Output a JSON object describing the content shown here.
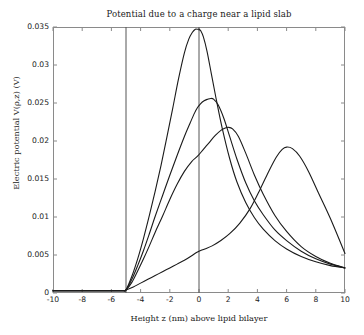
{
  "chart_data": {
    "type": "line",
    "title": "Potential due to a charge near a lipid slab",
    "xlabel": "Height z (nm) above lipid bilayer",
    "ylabel": "Electric potential V(ρ,z) (V)",
    "xlim": [
      -10,
      10
    ],
    "ylim": [
      0,
      0.035
    ],
    "grid": false,
    "legend": "none",
    "xticks": [
      "-10",
      "-8",
      "-6",
      "-4",
      "-2",
      "0",
      "2",
      "4",
      "6",
      "8",
      "10"
    ],
    "xtick_values": [
      -10,
      -8,
      -6,
      -4,
      -2,
      0,
      2,
      4,
      6,
      8,
      10
    ],
    "yticks": [
      "0",
      "0.005",
      "0.01",
      "0.015",
      "0.02",
      "0.025",
      "0.03",
      "0.035"
    ],
    "ytick_values": [
      0,
      0.005,
      0.01,
      0.015,
      0.02,
      0.025,
      0.03,
      0.035
    ],
    "line_color": "#1a1a1a",
    "annotations": [
      {
        "name": "slab-boundary-line",
        "type": "vline",
        "x": -5
      },
      {
        "name": "origin-line",
        "type": "vline",
        "x": 0
      }
    ],
    "series": [
      {
        "name": "curve-peak-at-0",
        "peak_x": 0.0,
        "peak_y": 0.0347,
        "x": [
          -10,
          -8,
          -6,
          -5.2,
          -5,
          -4.6,
          -4.2,
          -3.8,
          -3.4,
          -3,
          -2.6,
          -2.2,
          -1.8,
          -1.4,
          -1.0,
          -0.7,
          -0.45,
          -0.25,
          -0.1,
          0,
          0.12,
          0.3,
          0.55,
          0.85,
          1.2,
          1.6,
          2.1,
          2.6,
          3.2,
          3.8,
          4.4,
          5.2,
          6.0,
          7.0,
          8.0,
          9.0,
          10
        ],
        "y": [
          0.0003,
          0.0003,
          0.0003,
          0.0003,
          0.0004,
          0.0022,
          0.0045,
          0.0072,
          0.0102,
          0.0134,
          0.0168,
          0.0205,
          0.0243,
          0.0282,
          0.0316,
          0.0334,
          0.0343,
          0.0347,
          0.0347,
          0.0347,
          0.0345,
          0.0337,
          0.0318,
          0.0288,
          0.0253,
          0.0216,
          0.0177,
          0.0146,
          0.0119,
          0.0099,
          0.0084,
          0.0069,
          0.0058,
          0.0048,
          0.0041,
          0.0036,
          0.0033
        ]
      },
      {
        "name": "curve-peak-at-0p8",
        "peak_x": 0.8,
        "peak_y": 0.0256,
        "x": [
          -10,
          -8,
          -6,
          -5.2,
          -5,
          -4.6,
          -4.2,
          -3.8,
          -3.4,
          -3,
          -2.5,
          -2,
          -1.5,
          -1.0,
          -0.6,
          -0.3,
          -0.1,
          0.1,
          0.35,
          0.6,
          0.8,
          1.0,
          1.3,
          1.7,
          2.1,
          2.6,
          3.2,
          3.8,
          4.4,
          5.2,
          6.0,
          7.0,
          8.0,
          9.0,
          10
        ],
        "y": [
          0.0003,
          0.0003,
          0.0003,
          0.0003,
          0.0004,
          0.0018,
          0.0036,
          0.0056,
          0.0078,
          0.0101,
          0.0128,
          0.0155,
          0.0181,
          0.0206,
          0.0224,
          0.0237,
          0.0244,
          0.0249,
          0.0253,
          0.0255,
          0.0256,
          0.0255,
          0.0248,
          0.023,
          0.0206,
          0.0176,
          0.0145,
          0.0121,
          0.0103,
          0.0083,
          0.0069,
          0.0055,
          0.0045,
          0.0038,
          0.0033
        ]
      },
      {
        "name": "curve-peak-at-2",
        "peak_x": 2.0,
        "peak_y": 0.0218,
        "x": [
          -10,
          -8,
          -6,
          -5.2,
          -5,
          -4.6,
          -4.2,
          -3.8,
          -3.4,
          -3,
          -2.5,
          -2,
          -1.5,
          -1.0,
          -0.5,
          -0.1,
          0.3,
          0.7,
          1.1,
          1.5,
          1.8,
          2.0,
          2.3,
          2.7,
          3.2,
          3.8,
          4.4,
          5.2,
          6.0,
          7.0,
          8.0,
          9.0,
          10
        ],
        "y": [
          0.0003,
          0.0003,
          0.0003,
          0.0003,
          0.0004,
          0.0014,
          0.0029,
          0.0045,
          0.0062,
          0.008,
          0.0101,
          0.0123,
          0.0143,
          0.016,
          0.0173,
          0.018,
          0.0189,
          0.0198,
          0.0207,
          0.0214,
          0.0217,
          0.0218,
          0.0216,
          0.0206,
          0.0184,
          0.0155,
          0.013,
          0.0102,
          0.0081,
          0.0061,
          0.0048,
          0.0039,
          0.0033
        ]
      },
      {
        "name": "curve-peak-at-6",
        "peak_x": 6.0,
        "peak_y": 0.0192,
        "x": [
          -10,
          -8,
          -6,
          -5.2,
          -5,
          -4.5,
          -4,
          -3.5,
          -3,
          -2.5,
          -2,
          -1.5,
          -1.0,
          -0.5,
          -0.2,
          0,
          0.4,
          0.9,
          1.5,
          2.1,
          2.8,
          3.5,
          4.2,
          4.8,
          5.3,
          5.7,
          6.0,
          6.4,
          6.9,
          7.5,
          8.2,
          9.0,
          10
        ],
        "y": [
          0.0003,
          0.0003,
          0.0003,
          0.0003,
          0.0004,
          0.0008,
          0.0013,
          0.0018,
          0.0023,
          0.0028,
          0.0033,
          0.0038,
          0.0043,
          0.0049,
          0.0053,
          0.0055,
          0.0058,
          0.0062,
          0.0069,
          0.0078,
          0.0092,
          0.0111,
          0.0137,
          0.0161,
          0.0179,
          0.0189,
          0.0192,
          0.019,
          0.018,
          0.016,
          0.0131,
          0.0098,
          0.0052
        ]
      }
    ]
  }
}
